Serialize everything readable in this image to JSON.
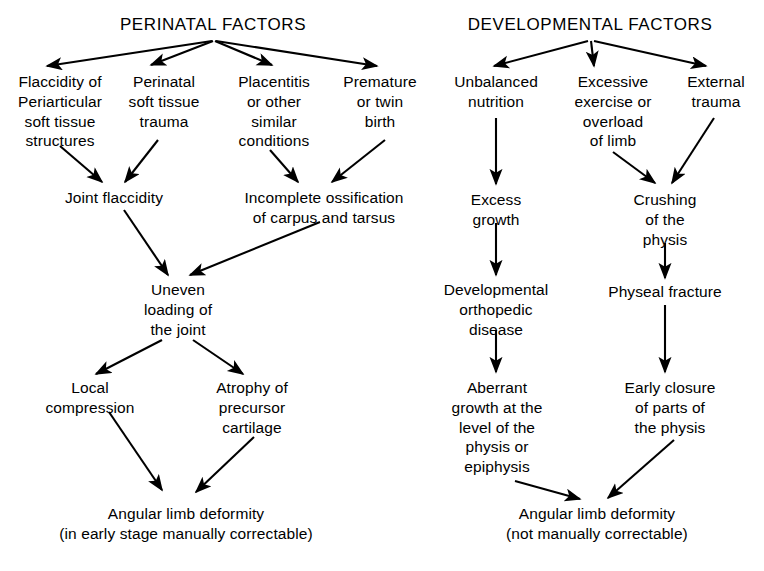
{
  "figure": {
    "background_color": "#ffffff",
    "text_color": "#000000",
    "arrow_color": "#000000"
  },
  "columns": {
    "left": {
      "title": "PERINATAL FACTORS"
    },
    "right": {
      "title": "DEVELOPMENTAL FACTORS"
    }
  },
  "nodes": {
    "perinatal_factors": "PERINATAL FACTORS",
    "developmental_factors": "DEVELOPMENTAL FACTORS",
    "flaccidity": "Flaccidity of\nPeriarticular\nsoft tissue\nstructures",
    "perinatal_soft_tissue_trauma": "Perinatal\nsoft tissue\ntrauma",
    "placentitis": "Placentitis\nor other\nsimilar\nconditions",
    "premature_birth": "Premature\nor twin\nbirth",
    "joint_flaccidity": "Joint flaccidity",
    "incomplete_ossification": "Incomplete ossification\nof carpus and tarsus",
    "uneven_loading": "Uneven\nloading of\nthe joint",
    "local_compression": "Local\ncompression",
    "atrophy_precursor_cartilage": "Atrophy of\nprecursor\ncartilage",
    "angular_limb_deformity_left": "Angular limb deformity\n(in early stage manually correctable)",
    "unbalanced_nutrition": "Unbalanced\nnutrition",
    "excessive_exercise": "Excessive\nexercise or\noverload\nof limb",
    "external_trauma": "External\ntrauma",
    "excess_growth": "Excess\ngrowth",
    "crushing_physis": "Crushing\nof the\nphysis",
    "developmental_orthopedic_disease": "Developmental\northopedic\ndisease",
    "physeal_fracture": "Physeal fracture",
    "aberrant_growth": "Aberrant\ngrowth at the\nlevel of the\nphysis or\nepiphysis",
    "early_closure": "Early closure\nof parts of\nthe physis",
    "angular_limb_deformity_right": "Angular limb deformity\n(not manually correctable)"
  },
  "edges": [
    {
      "from": "perinatal_factors",
      "to": "flaccidity"
    },
    {
      "from": "perinatal_factors",
      "to": "perinatal_soft_tissue_trauma"
    },
    {
      "from": "perinatal_factors",
      "to": "placentitis"
    },
    {
      "from": "perinatal_factors",
      "to": "premature_birth"
    },
    {
      "from": "flaccidity",
      "to": "joint_flaccidity"
    },
    {
      "from": "perinatal_soft_tissue_trauma",
      "to": "joint_flaccidity"
    },
    {
      "from": "placentitis",
      "to": "incomplete_ossification"
    },
    {
      "from": "premature_birth",
      "to": "incomplete_ossification"
    },
    {
      "from": "joint_flaccidity",
      "to": "uneven_loading"
    },
    {
      "from": "incomplete_ossification",
      "to": "uneven_loading"
    },
    {
      "from": "uneven_loading",
      "to": "local_compression"
    },
    {
      "from": "uneven_loading",
      "to": "atrophy_precursor_cartilage"
    },
    {
      "from": "local_compression",
      "to": "angular_limb_deformity_left"
    },
    {
      "from": "atrophy_precursor_cartilage",
      "to": "angular_limb_deformity_left"
    },
    {
      "from": "developmental_factors",
      "to": "unbalanced_nutrition"
    },
    {
      "from": "developmental_factors",
      "to": "excessive_exercise"
    },
    {
      "from": "developmental_factors",
      "to": "external_trauma"
    },
    {
      "from": "unbalanced_nutrition",
      "to": "excess_growth"
    },
    {
      "from": "excessive_exercise",
      "to": "crushing_physis"
    },
    {
      "from": "external_trauma",
      "to": "crushing_physis"
    },
    {
      "from": "excess_growth",
      "to": "developmental_orthopedic_disease"
    },
    {
      "from": "crushing_physis",
      "to": "physeal_fracture"
    },
    {
      "from": "developmental_orthopedic_disease",
      "to": "aberrant_growth"
    },
    {
      "from": "physeal_fracture",
      "to": "early_closure"
    },
    {
      "from": "aberrant_growth",
      "to": "angular_limb_deformity_right"
    },
    {
      "from": "early_closure",
      "to": "angular_limb_deformity_right"
    }
  ]
}
